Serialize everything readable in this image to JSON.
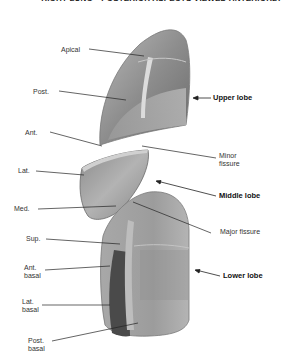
{
  "title": "RIGHT LUNG—POSTERIOR ASPECTS VIEWED ANTERIORLY",
  "colors": {
    "lobe_light": "#c9c9c9",
    "lobe_mid": "#9a9a9a",
    "lobe_dark": "#4a4a4a",
    "leader_line": "#222222",
    "text": "#333333"
  },
  "lobes": {
    "upper": "Upper lobe",
    "middle": "Middle lobe",
    "lower": "Lower lobe"
  },
  "fissures": {
    "minor_line1": "Minor",
    "minor_line2": "fissure",
    "major": "Major fissure"
  },
  "segments": {
    "apical": "Apical",
    "post": "Post.",
    "ant": "Ant.",
    "lat": "Lat.",
    "med": "Med.",
    "sup": "Sup.",
    "ant_basal_line1": "Ant.",
    "ant_basal_line2": "basal",
    "lat_basal_line1": "Lat.",
    "lat_basal_line2": "basal",
    "post_basal_line1": "Post.",
    "post_basal_line2": "basal"
  }
}
